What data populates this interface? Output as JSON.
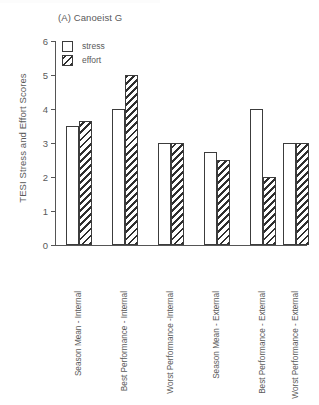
{
  "panel": {
    "title": "(A) Canoeist G"
  },
  "legend": {
    "position": "top-left",
    "items": [
      {
        "label": "stress",
        "swatch": "open-square"
      },
      {
        "label": "effort",
        "swatch": "hatched-square"
      }
    ]
  },
  "axes": {
    "ylabel": "TESI Stress and Effort Scores",
    "yticks": [
      "0",
      "1",
      "2",
      "3",
      "4",
      "5",
      "6"
    ],
    "ymin": 0,
    "ymax": 6
  },
  "chart_data": {
    "type": "bar",
    "title": "(A) Canoeist G",
    "xlabel": "",
    "ylabel": "TESI Stress and Effort Scores",
    "ylim": [
      0,
      6
    ],
    "yticks": [
      0,
      1,
      2,
      3,
      4,
      5,
      6
    ],
    "grid": false,
    "legend_position": "top-left",
    "categories": [
      "Season Mean - Internal",
      "Best Performance - Internal",
      "Worst Performance -Internal",
      "Season Mean - External",
      "Best Performance - External",
      "Worst Performance - External"
    ],
    "series": [
      {
        "name": "stress",
        "values": [
          3.5,
          4.0,
          3.0,
          2.75,
          4.0,
          3.0
        ]
      },
      {
        "name": "effort",
        "values": [
          3.65,
          5.0,
          3.0,
          2.5,
          2.0,
          3.0
        ]
      }
    ]
  }
}
